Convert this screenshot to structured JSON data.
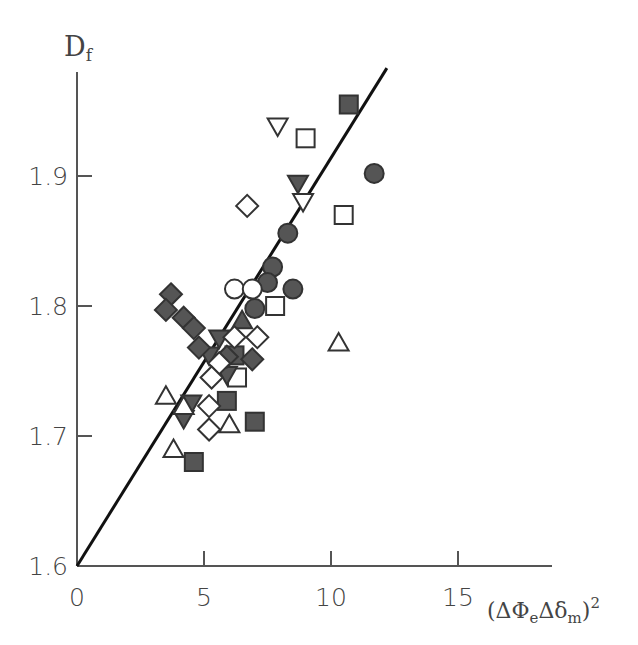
{
  "chart_data": {
    "type": "scatter",
    "title": "",
    "ylabel": "D_f",
    "ylabel_main": "D",
    "ylabel_sub": "f",
    "xlabel": "(ΔΦ_e Δδ_m)^2",
    "xlabel_parts": {
      "open": "(ΔΦ",
      "sub1": "e",
      "mid": "Δδ",
      "sub2": "m",
      "close": ")",
      "sup": "2"
    },
    "xlim": [
      0,
      18
    ],
    "ylim": [
      1.6,
      1.98
    ],
    "x_ticks": [
      0,
      5,
      10,
      15
    ],
    "x_tick_labels": [
      "0",
      "5",
      "10",
      "15"
    ],
    "y_ticks": [
      1.6,
      1.7,
      1.8,
      1.9
    ],
    "y_tick_labels": [
      "1.6",
      "1.7",
      "1.8",
      "1.9"
    ],
    "grid": false,
    "legend": null,
    "fit_line": {
      "x": [
        0,
        12.2
      ],
      "y": [
        1.6,
        1.983
      ],
      "color": "#111111"
    },
    "fill_color": "#555555",
    "stroke_color": "#333333",
    "series": [
      {
        "name": "filled-square",
        "marker": "square",
        "filled": true,
        "points": [
          [
            10.7,
            1.955
          ],
          [
            6.2,
            1.762
          ],
          [
            5.9,
            1.727
          ],
          [
            4.6,
            1.68
          ],
          [
            7.0,
            1.711
          ]
        ]
      },
      {
        "name": "open-square",
        "marker": "square",
        "filled": false,
        "points": [
          [
            9.0,
            1.929
          ],
          [
            10.5,
            1.87
          ],
          [
            7.8,
            1.8
          ],
          [
            6.3,
            1.745
          ]
        ]
      },
      {
        "name": "filled-circle",
        "marker": "circle",
        "filled": true,
        "points": [
          [
            11.7,
            1.902
          ],
          [
            8.3,
            1.856
          ],
          [
            7.7,
            1.83
          ],
          [
            7.5,
            1.818
          ],
          [
            7.0,
            1.798
          ],
          [
            8.5,
            1.813
          ]
        ]
      },
      {
        "name": "open-circle",
        "marker": "circle",
        "filled": false,
        "points": [
          [
            6.2,
            1.813
          ],
          [
            6.9,
            1.813
          ]
        ]
      },
      {
        "name": "filled-triangle-down",
        "marker": "triangle-down",
        "filled": true,
        "points": [
          [
            8.7,
            1.894
          ],
          [
            5.6,
            1.775
          ],
          [
            5.2,
            1.762
          ],
          [
            5.9,
            1.747
          ],
          [
            4.5,
            1.725
          ],
          [
            4.2,
            1.713
          ]
        ]
      },
      {
        "name": "open-triangle-down",
        "marker": "triangle-down",
        "filled": false,
        "points": [
          [
            7.9,
            1.938
          ],
          [
            8.9,
            1.88
          ]
        ]
      },
      {
        "name": "open-triangle-up",
        "marker": "triangle-up",
        "filled": false,
        "points": [
          [
            10.3,
            1.772
          ],
          [
            3.5,
            1.731
          ],
          [
            4.2,
            1.723
          ],
          [
            6.0,
            1.709
          ],
          [
            3.8,
            1.69
          ]
        ]
      },
      {
        "name": "filled-triangle-up",
        "marker": "triangle-up",
        "filled": true,
        "points": [
          [
            6.5,
            1.789
          ]
        ]
      },
      {
        "name": "filled-diamond",
        "marker": "diamond",
        "filled": true,
        "points": [
          [
            3.7,
            1.809
          ],
          [
            3.5,
            1.797
          ],
          [
            4.2,
            1.791
          ],
          [
            4.6,
            1.783
          ],
          [
            4.8,
            1.768
          ],
          [
            5.9,
            1.761
          ],
          [
            6.9,
            1.759
          ]
        ]
      },
      {
        "name": "open-diamond",
        "marker": "diamond",
        "filled": false,
        "points": [
          [
            6.7,
            1.877
          ],
          [
            6.2,
            1.776
          ],
          [
            7.1,
            1.776
          ],
          [
            5.6,
            1.756
          ],
          [
            5.3,
            1.745
          ],
          [
            5.2,
            1.723
          ],
          [
            5.2,
            1.705
          ]
        ]
      }
    ]
  }
}
